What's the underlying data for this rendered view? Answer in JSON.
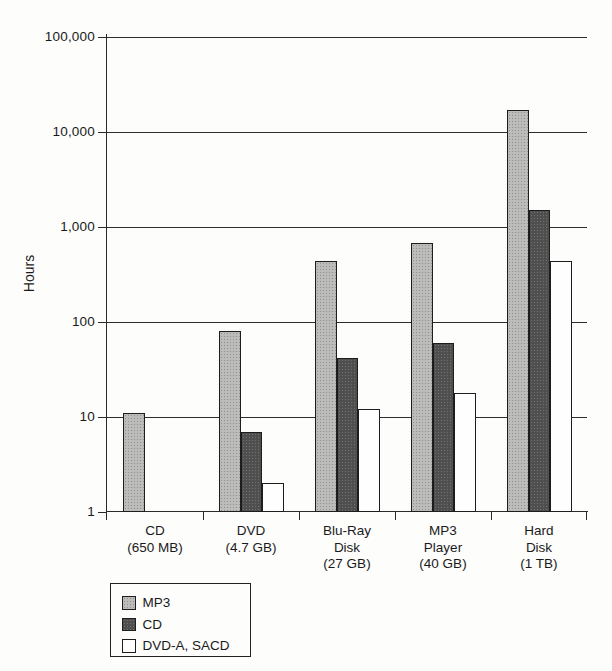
{
  "chart_data": {
    "type": "bar",
    "title": "",
    "xlabel": "",
    "ylabel": "Hours",
    "yscale": "log",
    "ylim": [
      1,
      100000
    ],
    "grid": true,
    "legend_position": "bottom-left",
    "yticks": [
      1,
      10,
      100,
      1000,
      10000,
      100000
    ],
    "ytick_labels": [
      "1",
      "10",
      "100",
      "1,000",
      "10,000",
      "100,000"
    ],
    "categories": [
      [
        "CD",
        "(650 MB)"
      ],
      [
        "DVD",
        "(4.7 GB)"
      ],
      [
        "Blu-Ray",
        "Disk",
        "(27 GB)"
      ],
      [
        "MP3",
        "Player",
        "(40 GB)"
      ],
      [
        "Hard",
        "Disk",
        "(1 TB)"
      ]
    ],
    "series": [
      {
        "name": "MP3",
        "color": "#bcbdbb",
        "values": [
          11,
          80,
          440,
          680,
          17000
        ]
      },
      {
        "name": "CD",
        "color": "#4f4f4f",
        "values": [
          null,
          7,
          42,
          60,
          1500
        ]
      },
      {
        "name": "DVD-A, SACD",
        "color": "#fefefe",
        "values": [
          null,
          2,
          12,
          18,
          440
        ]
      }
    ],
    "line_color": "#2a2a2a"
  }
}
